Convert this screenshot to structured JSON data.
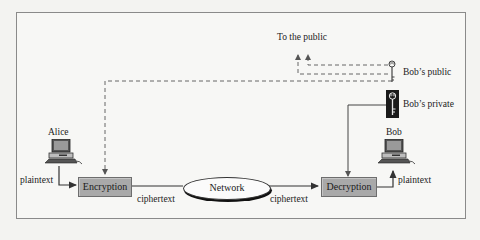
{
  "diagram": {
    "type": "public-key-cryptosystem",
    "sender": {
      "label": "Alice"
    },
    "receiver": {
      "label": "Bob"
    },
    "nodes": {
      "encryption": "Encryption",
      "decryption": "Decryption",
      "network": "Network"
    },
    "keys": {
      "public": "Bob’s public",
      "private": "Bob’s private",
      "distribution": "To the public"
    },
    "edges": {
      "alice_plaintext": "plaintext",
      "enc_ciphertext": "ciphertext",
      "net_ciphertext": "ciphertext",
      "bob_plaintext": "plaintext"
    },
    "colors": {
      "box_fill": "#a9a9a9",
      "line": "#333333",
      "dashed_line": "#555555",
      "frame": "#8a8a8a",
      "private_key_bg": "#1a1a1a"
    }
  }
}
